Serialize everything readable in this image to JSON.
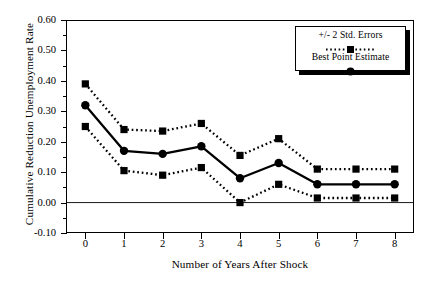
{
  "chart_data": {
    "type": "line",
    "title": "",
    "xlabel": "Number of Years After Shock",
    "ylabel": "Cumulative Reduction Unemployment Rate",
    "x": [
      0,
      1,
      2,
      3,
      4,
      5,
      6,
      7,
      8
    ],
    "xlim": [
      -0.5,
      8.5
    ],
    "ylim": [
      -0.1,
      0.6
    ],
    "xticks": [
      "0",
      "1",
      "2",
      "3",
      "4",
      "5",
      "6",
      "7",
      "8"
    ],
    "yticks": [
      "0.60",
      "0.50",
      "0.40",
      "0.30",
      "0.20",
      "0.10",
      "0.00",
      "-0.10"
    ],
    "ytick_values": [
      0.6,
      0.5,
      0.4,
      0.3,
      0.2,
      0.1,
      0.0,
      -0.1
    ],
    "grid": false,
    "zero_line": true,
    "legend_position": "top-right",
    "series": [
      {
        "name": "+/- 2 Std. Errors",
        "role": "upper-band",
        "style": "dotted",
        "marker": "square",
        "color": "#000000",
        "values": [
          0.39,
          0.24,
          0.235,
          0.26,
          0.155,
          0.21,
          0.11,
          0.11,
          0.11
        ]
      },
      {
        "name": "Best Point Estimate",
        "role": "center",
        "style": "solid",
        "marker": "circle",
        "color": "#000000",
        "values": [
          0.32,
          0.17,
          0.16,
          0.185,
          0.08,
          0.13,
          0.06,
          0.06,
          0.06
        ]
      },
      {
        "name": "+/- 2 Std. Errors",
        "role": "lower-band",
        "style": "dotted",
        "marker": "square",
        "color": "#000000",
        "values": [
          0.25,
          0.105,
          0.09,
          0.115,
          0.0,
          0.06,
          0.015,
          0.015,
          0.015
        ]
      }
    ],
    "legend": [
      {
        "label": "+/- 2 Std. Errors",
        "style": "dotted",
        "marker": "square"
      },
      {
        "label": "Best Point Estimate",
        "style": "solid",
        "marker": "circle"
      }
    ]
  }
}
